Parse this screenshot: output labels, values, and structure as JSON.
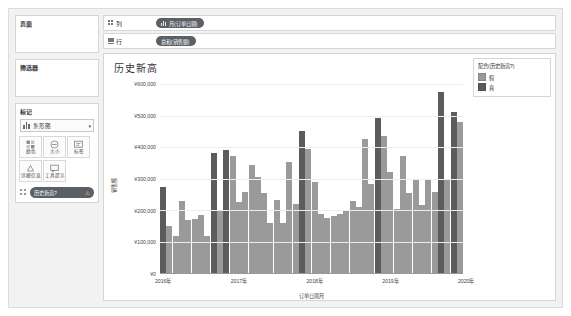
{
  "left_panel": {
    "pages": {
      "title": "页面"
    },
    "filters": {
      "title": "筛选器"
    },
    "marks": {
      "title": "标记",
      "mark_type": "条形图",
      "caret": "▾",
      "properties": [
        {
          "name": "color",
          "label": "颜色"
        },
        {
          "name": "size",
          "label": "大小"
        },
        {
          "name": "label",
          "label": "标签"
        },
        {
          "name": "detail",
          "label": "详细信息"
        },
        {
          "name": "tooltip",
          "label": "工具提示"
        }
      ],
      "pill": {
        "label": "历史新高?",
        "warning": "⚠"
      }
    }
  },
  "shelves": {
    "columns": {
      "label": "列",
      "pill": "月(订单日期)"
    },
    "rows": {
      "label": "行",
      "pill": "总和(销售额)"
    }
  },
  "viz": {
    "title": "历史新高",
    "legend": {
      "title": "配合(历史新高?)",
      "items": [
        {
          "label": "假",
          "color": "#9a9a9a"
        },
        {
          "label": "真",
          "color": "#5c5c5c"
        }
      ]
    }
  },
  "chart_data": {
    "type": "bar",
    "title": "历史新高",
    "xlabel": "订单日期月",
    "ylabel": "销售额",
    "ylim": [
      0,
      600000
    ],
    "yticks": [
      0,
      100000,
      200000,
      300000,
      400000,
      500000,
      600000
    ],
    "ytick_labels": [
      "¥0",
      "¥100,000",
      "¥200,000",
      "¥300,000",
      "¥400,000",
      "¥500,000",
      "¥600,000"
    ],
    "xtick_labels": [
      "2016年",
      "2017年",
      "2018年",
      "2019年",
      "2020年"
    ],
    "grid": true,
    "legend_position": "right",
    "colors": {
      "false": "#9a9a9a",
      "true": "#5c5c5c"
    },
    "categories": [
      "2016-01",
      "2016-02",
      "2016-03",
      "2016-04",
      "2016-05",
      "2016-06",
      "2016-07",
      "2016-08",
      "2016-09",
      "2016-10",
      "2016-11",
      "2016-12",
      "2017-01",
      "2017-02",
      "2017-03",
      "2017-04",
      "2017-05",
      "2017-06",
      "2017-07",
      "2017-08",
      "2017-09",
      "2017-10",
      "2017-11",
      "2017-12",
      "2018-01",
      "2018-02",
      "2018-03",
      "2018-04",
      "2018-05",
      "2018-06",
      "2018-07",
      "2018-08",
      "2018-09",
      "2018-10",
      "2018-11",
      "2018-12",
      "2019-01",
      "2019-02",
      "2019-03",
      "2019-04",
      "2019-05",
      "2019-06",
      "2019-07",
      "2019-08",
      "2019-09",
      "2019-10",
      "2019-11",
      "2019-12"
    ],
    "values": [
      272000,
      148000,
      118000,
      228000,
      168000,
      172000,
      185000,
      118000,
      380000,
      200000,
      392000,
      372000,
      225000,
      258000,
      342000,
      305000,
      255000,
      160000,
      232000,
      158000,
      352000,
      218000,
      452000,
      395000,
      290000,
      188000,
      175000,
      182000,
      188000,
      200000,
      230000,
      208000,
      425000,
      282000,
      492000,
      435000,
      320000,
      202000,
      370000,
      255000,
      295000,
      215000,
      300000,
      258000,
      575000,
      300000,
      512000,
      478000
    ],
    "series_flag": [
      "true",
      "false",
      "false",
      "false",
      "false",
      "false",
      "false",
      "false",
      "true",
      "false",
      "true",
      "false",
      "false",
      "false",
      "false",
      "false",
      "false",
      "false",
      "false",
      "false",
      "false",
      "false",
      "true",
      "false",
      "false",
      "false",
      "false",
      "false",
      "false",
      "false",
      "false",
      "false",
      "false",
      "false",
      "true",
      "false",
      "false",
      "false",
      "false",
      "false",
      "false",
      "false",
      "false",
      "false",
      "true",
      "false",
      "true",
      "false"
    ]
  }
}
